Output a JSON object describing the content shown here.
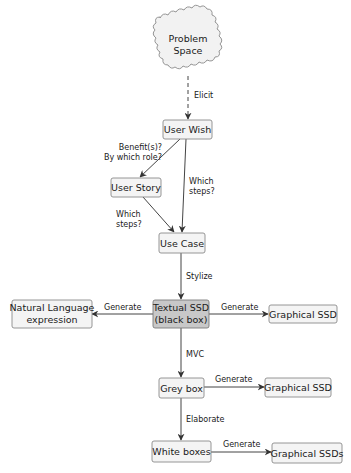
{
  "diagram": {
    "title": "",
    "nodes": {
      "problem_space": {
        "line1": "Problem",
        "line2": "Space",
        "shape": "cloud"
      },
      "user_wish": {
        "label": "User Wish"
      },
      "user_story": {
        "label": "User Story"
      },
      "use_case": {
        "label": "Use Case"
      },
      "textual_ssd": {
        "line1": "Textual SSD",
        "line2": "(black box)",
        "fill": "#c8c8c8"
      },
      "natural_language": {
        "line1": "Natural Language",
        "line2": "expression"
      },
      "graphical_ssd_1": {
        "label": "Graphical SSD"
      },
      "grey_box": {
        "label": "Grey box"
      },
      "graphical_ssd_2": {
        "label": "Graphical SSD"
      },
      "white_boxes": {
        "label": "White boxes"
      },
      "graphical_ssds": {
        "label": "Graphical SSDs"
      }
    },
    "edges": {
      "elicit": {
        "label": "Elicit",
        "from": "Problem Space",
        "to": "User Wish",
        "style": "dashed"
      },
      "benefits": {
        "line1": "Benefit(s)?",
        "line2": "By which role?",
        "from": "User Wish",
        "to": "User Story"
      },
      "which_steps_right": {
        "line1": "Which",
        "line2": "steps?",
        "from": "User Wish",
        "to": "Use Case"
      },
      "which_steps_left": {
        "line1": "Which",
        "line2": "steps?",
        "from": "User Story",
        "to": "Use Case"
      },
      "stylize": {
        "label": "Stylize",
        "from": "Use Case",
        "to": "Textual SSD (black box)"
      },
      "generate_nl": {
        "label": "Generate",
        "from": "Textual SSD (black box)",
        "to": "Natural Language expression"
      },
      "generate_g1": {
        "label": "Generate",
        "from": "Textual SSD (black box)",
        "to": "Graphical SSD"
      },
      "mvc": {
        "label": "MVC",
        "from": "Textual SSD (black box)",
        "to": "Grey box"
      },
      "generate_g2": {
        "label": "Generate",
        "from": "Grey box",
        "to": "Graphical SSD"
      },
      "elaborate": {
        "label": "Elaborate",
        "from": "Grey box",
        "to": "White boxes"
      },
      "generate_g3": {
        "label": "Generate",
        "from": "White boxes",
        "to": "Graphical SSDs"
      }
    },
    "colors": {
      "box_fill": "#f4f4f4",
      "box_stroke": "#8a8a8a",
      "highlight_fill": "#c8c8c8",
      "edge": "#444444"
    }
  }
}
